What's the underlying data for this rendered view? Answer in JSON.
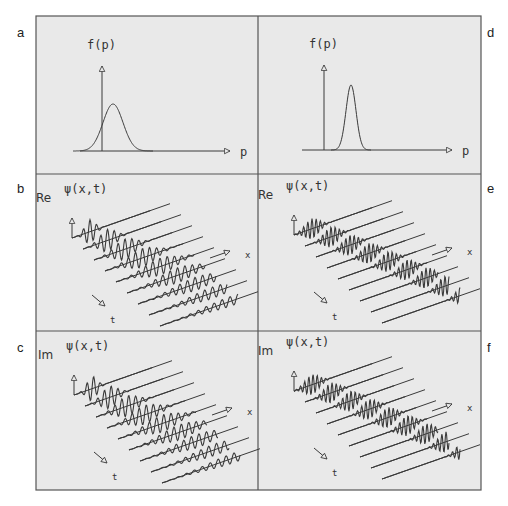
{
  "figure": {
    "background": "#e9e9e9",
    "line_color": "#3a3a3a",
    "panels": [
      {
        "id": "a",
        "letter": "a",
        "type": "momentum-distribution",
        "ylabel": "f(p)",
        "xlabel": "p",
        "peak_width": "wide"
      },
      {
        "id": "b",
        "letter": "b",
        "type": "wavepacket-timeslices",
        "part_label": "Re",
        "func_label": "ψ(x,t)",
        "x_axis_label": "x",
        "t_axis_label": "t",
        "spreading": "strong"
      },
      {
        "id": "c",
        "letter": "c",
        "type": "wavepacket-timeslices",
        "part_label": "Im",
        "func_label": "ψ(x,t)",
        "x_axis_label": "x",
        "t_axis_label": "t",
        "spreading": "strong"
      },
      {
        "id": "d",
        "letter": "d",
        "type": "momentum-distribution",
        "ylabel": "f(p)",
        "xlabel": "p",
        "peak_width": "narrow"
      },
      {
        "id": "e",
        "letter": "e",
        "type": "wavepacket-timeslices",
        "part_label": "Re",
        "func_label": "ψ(x,t)",
        "x_axis_label": "x",
        "t_axis_label": "t",
        "spreading": "weak"
      },
      {
        "id": "f",
        "letter": "f",
        "type": "wavepacket-timeslices",
        "part_label": "Im",
        "func_label": "ψ(x,t)",
        "x_axis_label": "x",
        "t_axis_label": "t",
        "spreading": "weak"
      }
    ]
  },
  "chart_data": [
    {
      "type": "line",
      "panel": "a",
      "title": "",
      "xlabel": "p",
      "ylabel": "f(p)",
      "description": "Broad Gaussian momentum distribution, peak slightly right of vertical axis"
    },
    {
      "type": "line",
      "panel": "d",
      "title": "",
      "xlabel": "p",
      "ylabel": "f(p)",
      "description": "Narrow Gaussian momentum distribution, peak right of vertical axis"
    },
    {
      "type": "line",
      "panel": "b",
      "description": "Re ψ(x,t) at 9 successive time slices, packet spreads and disperses"
    },
    {
      "type": "line",
      "panel": "c",
      "description": "Im ψ(x,t) at 9 successive time slices, packet spreads and disperses"
    },
    {
      "type": "line",
      "panel": "e",
      "description": "Re ψ(x,t) at 9 time slices, packet moves with little spreading"
    },
    {
      "type": "line",
      "panel": "f",
      "description": "Im ψ(x,t) at 9 time slices, packet moves with little spreading"
    }
  ]
}
